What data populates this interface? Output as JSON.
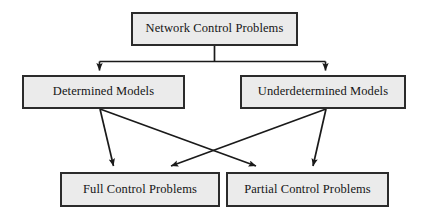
{
  "diagram": {
    "type": "flowchart",
    "background_color": "#ffffff",
    "node_fill_color": "#ebebeb",
    "node_border_color": "#2b2b2b",
    "connector_color": "#1a1a1a",
    "nodes": [
      {
        "id": "root",
        "label": "Network Control Problems",
        "level": 1
      },
      {
        "id": "determined",
        "label": "Determined Models",
        "level": 2
      },
      {
        "id": "underdetermined",
        "label": "Underdetermined Models",
        "level": 2
      },
      {
        "id": "full",
        "label": "Full Control Problems",
        "level": 3
      },
      {
        "id": "partial",
        "label": "Partial Control Problems",
        "level": 3
      }
    ],
    "edges": [
      {
        "from": "root",
        "to": "determined",
        "style": "orthogonal",
        "arrow": "end"
      },
      {
        "from": "root",
        "to": "underdetermined",
        "style": "orthogonal",
        "arrow": "end"
      },
      {
        "from": "determined",
        "to": "full",
        "style": "straight",
        "arrow": "end"
      },
      {
        "from": "determined",
        "to": "partial",
        "style": "straight",
        "arrow": "end"
      },
      {
        "from": "underdetermined",
        "to": "full",
        "style": "straight",
        "arrow": "end"
      },
      {
        "from": "underdetermined",
        "to": "partial",
        "style": "straight",
        "arrow": "end"
      }
    ]
  }
}
